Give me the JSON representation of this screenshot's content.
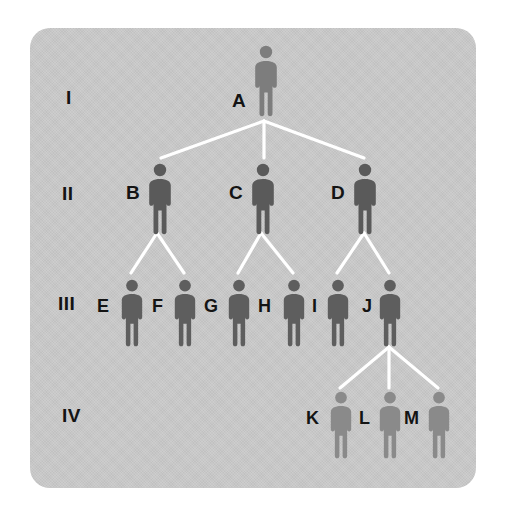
{
  "diagram": {
    "background_color": "#c9c9c9",
    "page_background": "#ffffff",
    "link_color": "#ffffff",
    "text_color": "#141414",
    "levels": [
      {
        "id": "level-1",
        "numeral": "I",
        "x": 66,
        "y": 88,
        "person_color": "#7d7d7d",
        "person_scale": 1.0
      },
      {
        "id": "level-2",
        "numeral": "II",
        "x": 62,
        "y": 184,
        "person_color": "#5a5a5a",
        "person_scale": 1.0
      },
      {
        "id": "level-3",
        "numeral": "III",
        "x": 58,
        "y": 294,
        "person_color": "#5e5e5e",
        "person_scale": 0.92
      },
      {
        "id": "level-4",
        "numeral": "IV",
        "x": 62,
        "y": 406,
        "person_color": "#8a8a8a",
        "person_scale": 0.92
      }
    ],
    "nodes": [
      {
        "id": "A",
        "label": "A",
        "level": 1,
        "person_x": 253,
        "person_y": 45,
        "label_x": 232,
        "label_y": 91,
        "color": "#7d7d7d",
        "w": 26,
        "h": 72,
        "font_size": 19
      },
      {
        "id": "B",
        "label": "B",
        "level": 2,
        "person_x": 147,
        "person_y": 163,
        "label_x": 126,
        "label_y": 183,
        "color": "#5a5a5a",
        "w": 26,
        "h": 72,
        "font_size": 19
      },
      {
        "id": "C",
        "label": "C",
        "level": 2,
        "person_x": 250,
        "person_y": 163,
        "label_x": 229,
        "label_y": 183,
        "color": "#5a5a5a",
        "w": 26,
        "h": 72,
        "font_size": 19
      },
      {
        "id": "D",
        "label": "D",
        "level": 2,
        "person_x": 352,
        "person_y": 163,
        "label_x": 331,
        "label_y": 183,
        "color": "#5a5a5a",
        "w": 26,
        "h": 72,
        "font_size": 19
      },
      {
        "id": "E",
        "label": "E",
        "level": 3,
        "person_x": 119,
        "person_y": 279,
        "label_x": 97,
        "label_y": 297,
        "color": "#5e5e5e",
        "w": 26,
        "h": 68,
        "font_size": 18
      },
      {
        "id": "F",
        "label": "F",
        "level": 3,
        "person_x": 172,
        "person_y": 279,
        "label_x": 152,
        "label_y": 297,
        "color": "#5e5e5e",
        "w": 26,
        "h": 68,
        "font_size": 18
      },
      {
        "id": "G",
        "label": "G",
        "level": 3,
        "person_x": 226,
        "person_y": 279,
        "label_x": 204,
        "label_y": 297,
        "color": "#5e5e5e",
        "w": 26,
        "h": 68,
        "font_size": 18
      },
      {
        "id": "H",
        "label": "H",
        "level": 3,
        "person_x": 281,
        "person_y": 279,
        "label_x": 258,
        "label_y": 297,
        "color": "#5e5e5e",
        "w": 26,
        "h": 68,
        "font_size": 18
      },
      {
        "id": "I",
        "label": "I",
        "level": 3,
        "person_x": 325,
        "person_y": 279,
        "label_x": 312,
        "label_y": 297,
        "color": "#5e5e5e",
        "w": 26,
        "h": 68,
        "font_size": 18
      },
      {
        "id": "J",
        "label": "J",
        "level": 3,
        "person_x": 377,
        "person_y": 279,
        "label_x": 362,
        "label_y": 297,
        "color": "#5e5e5e",
        "w": 26,
        "h": 68,
        "font_size": 18
      },
      {
        "id": "K",
        "label": "K",
        "level": 4,
        "person_x": 328,
        "person_y": 391,
        "label_x": 306,
        "label_y": 409,
        "color": "#8a8a8a",
        "w": 26,
        "h": 68,
        "font_size": 18
      },
      {
        "id": "L",
        "label": "L",
        "level": 4,
        "person_x": 377,
        "person_y": 391,
        "label_x": 359,
        "label_y": 409,
        "color": "#8a8a8a",
        "w": 26,
        "h": 68,
        "font_size": 18
      },
      {
        "id": "M",
        "label": "M",
        "level": 4,
        "person_x": 426,
        "person_y": 391,
        "label_x": 404,
        "label_y": 409,
        "color": "#8a8a8a",
        "w": 26,
        "h": 68,
        "font_size": 18
      }
    ],
    "edges": [
      {
        "from": "A",
        "to": "B"
      },
      {
        "from": "A",
        "to": "C"
      },
      {
        "from": "A",
        "to": "D"
      },
      {
        "from": "B",
        "to": "E"
      },
      {
        "from": "B",
        "to": "F"
      },
      {
        "from": "C",
        "to": "G"
      },
      {
        "from": "C",
        "to": "H"
      },
      {
        "from": "D",
        "to": "I"
      },
      {
        "from": "D",
        "to": "J"
      },
      {
        "from": "J",
        "to": "K"
      },
      {
        "from": "J",
        "to": "L"
      },
      {
        "from": "J",
        "to": "M"
      }
    ],
    "edge_geometry": [
      {
        "id": "edge-a-group",
        "apex_x": 264,
        "apex_y": 121,
        "child_y": 158,
        "children_x": [
          161,
          264,
          364
        ]
      },
      {
        "id": "edge-b-group",
        "apex_x": 157,
        "apex_y": 233,
        "child_y": 273,
        "children_x": [
          131,
          184
        ]
      },
      {
        "id": "edge-c-group",
        "apex_x": 261,
        "apex_y": 233,
        "child_y": 273,
        "children_x": [
          238,
          293
        ]
      },
      {
        "id": "edge-d-group",
        "apex_x": 364,
        "apex_y": 233,
        "child_y": 273,
        "children_x": [
          337,
          389
        ]
      },
      {
        "id": "edge-j-group",
        "apex_x": 389,
        "apex_y": 347,
        "child_y": 388,
        "children_x": [
          340,
          389,
          438
        ]
      }
    ]
  }
}
